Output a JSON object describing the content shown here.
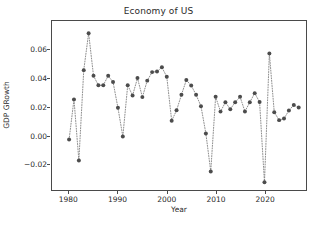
{
  "chart_data": {
    "type": "scatter",
    "title": "Economy of US",
    "xlabel": "Year",
    "ylabel": "GDP GRowth",
    "grid": false,
    "legend": null,
    "marker": {
      "shape": "circle",
      "color": "#4c4c4c",
      "size": 4
    },
    "line": {
      "style": "dotted",
      "color": "#808080"
    },
    "xlim": [
      1976.5,
      2028.5
    ],
    "ylim": [
      -0.0385,
      0.0805
    ],
    "xticks": [
      1980,
      1990,
      2000,
      2010,
      2020
    ],
    "xtick_labels": [
      "1980",
      "1990",
      "2000",
      "2010",
      "2020"
    ],
    "yticks": [
      -0.02,
      0.0,
      0.02,
      0.04,
      0.06
    ],
    "ytick_labels": [
      "−0.02",
      "0.00",
      "0.02",
      "0.04",
      "0.06"
    ],
    "x": [
      1980,
      1981,
      1982,
      1983,
      1984,
      1985,
      1986,
      1987,
      1988,
      1989,
      1990,
      1991,
      1992,
      1993,
      1994,
      1995,
      1996,
      1997,
      1998,
      1999,
      2000,
      2001,
      2002,
      2003,
      2004,
      2005,
      2006,
      2007,
      2008,
      2009,
      2010,
      2011,
      2012,
      2013,
      2014,
      2015,
      2016,
      2017,
      2018,
      2019,
      2020,
      2021,
      2022,
      2023,
      2024,
      2025,
      2026,
      2027
    ],
    "values": [
      -0.003,
      0.0253,
      -0.0177,
      0.0459,
      0.0719,
      0.0419,
      0.0352,
      0.0353,
      0.0419,
      0.0375,
      0.0194,
      -0.0008,
      0.0352,
      0.0281,
      0.0403,
      0.0269,
      0.0385,
      0.0445,
      0.0449,
      0.0479,
      0.0412,
      0.0103,
      0.0176,
      0.0285,
      0.0389,
      0.0351,
      0.0285,
      0.0205,
      0.0013,
      -0.0254,
      0.0271,
      0.0167,
      0.0233,
      0.0184,
      0.0233,
      0.0271,
      0.0168,
      0.0233,
      0.0297,
      0.0234,
      -0.0331,
      0.0577,
      0.0163,
      0.0107,
      0.0118,
      0.0175,
      0.0214,
      0.0196
    ],
    "series_name": "GDP Growth"
  }
}
